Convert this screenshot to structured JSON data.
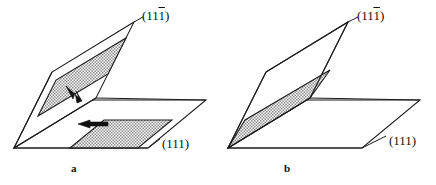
{
  "figure": {
    "kind": "crystallographic-slip-plane-diagram",
    "background_color": "#ffffff",
    "line_color": "#1b1b1b",
    "hatch_color": "#8c8c8c",
    "panel_count": 2
  },
  "panels": [
    {
      "id": "a",
      "letter": "a",
      "caption_letter": "a",
      "inclined_plane_label": {
        "prefix": "(11",
        "overbar_digit": "1",
        "suffix": ")",
        "full_text": "(111̅)"
      },
      "horizontal_plane_label": {
        "full_text": "(111)"
      },
      "bands": [
        {
          "name": "inclined-slip-band",
          "plane": "inclined",
          "position": "mid-plane"
        },
        {
          "name": "horizontal-slip-band",
          "plane": "horizontal",
          "position": "right-of-intersection"
        }
      ],
      "arrows": [
        {
          "name": "inclined-plane-arrow",
          "direction": "down-right",
          "plane": "inclined"
        },
        {
          "name": "horizontal-plane-arrow",
          "direction": "left",
          "plane": "horizontal"
        }
      ]
    },
    {
      "id": "b",
      "letter": "b",
      "caption_letter": "b",
      "inclined_plane_label": {
        "prefix": "(11",
        "overbar_digit": "1",
        "suffix": ")",
        "full_text": "(111̅)"
      },
      "horizontal_plane_label": {
        "full_text": "(111)"
      },
      "bands": [
        {
          "name": "merged-slip-band",
          "plane": "inclined",
          "position": "at-intersection-line"
        }
      ],
      "arrows": []
    }
  ]
}
